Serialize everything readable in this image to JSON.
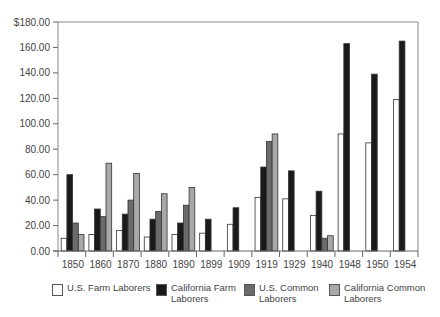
{
  "chart_data": {
    "type": "bar",
    "title": "",
    "xlabel": "",
    "ylabel": "",
    "ylim": [
      0,
      180
    ],
    "y_ticks": [
      "$180.00",
      "160.00",
      "140.00",
      "120.00",
      "100.00",
      "80.00",
      "60.00",
      "40.00",
      "20.00",
      "0.00"
    ],
    "y_tick_values": [
      180,
      160,
      140,
      120,
      100,
      80,
      60,
      40,
      20,
      0
    ],
    "grid": false,
    "legend_position": "bottom",
    "categories": [
      "1850",
      "1860",
      "1870",
      "1880",
      "1890",
      "1899",
      "1909",
      "1919",
      "1929",
      "1940",
      "1948",
      "1950",
      "1954"
    ],
    "series": [
      {
        "name": "U.S. Farm Laborers",
        "color": "#ffffff",
        "values": [
          10,
          13,
          16,
          11,
          13,
          14,
          21,
          42,
          41,
          28,
          92,
          85,
          119
        ]
      },
      {
        "name": "California Farm Laborers",
        "color": "#1a1a1a",
        "values": [
          60,
          33,
          29,
          25,
          22,
          25,
          34,
          66,
          63,
          47,
          163,
          139,
          165
        ]
      },
      {
        "name": "U.S. Common Laborers",
        "color": "#6b6b6b",
        "values": [
          22,
          27,
          40,
          31,
          36,
          null,
          null,
          86,
          null,
          10,
          null,
          null,
          null
        ]
      },
      {
        "name": "California Common Laborers",
        "color": "#a8a8a8",
        "values": [
          13,
          69,
          61,
          45,
          50,
          null,
          null,
          92,
          null,
          12,
          null,
          null,
          null
        ]
      }
    ]
  },
  "legend": {
    "items": [
      {
        "label": "U.S. Farm Laborers",
        "color": "#ffffff"
      },
      {
        "label": "California Farm\nLaborers",
        "color": "#1a1a1a"
      },
      {
        "label": "U.S. Common\nLaborers",
        "color": "#6b6b6b"
      },
      {
        "label": "California Common\nLaborers",
        "color": "#a8a8a8"
      }
    ]
  }
}
